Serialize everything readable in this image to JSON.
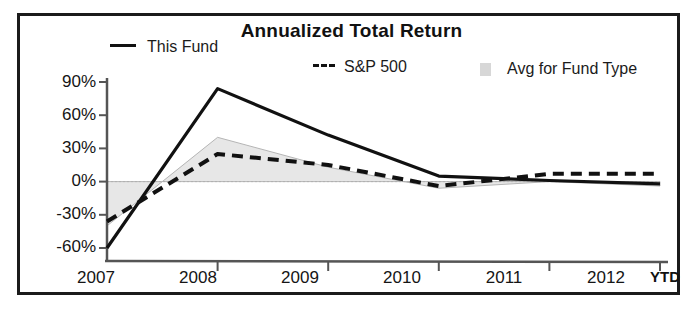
{
  "chart_data": {
    "type": "line",
    "title": "Annualized Total Return",
    "xlabel": "",
    "ylabel": "",
    "categories": [
      "2007",
      "2008",
      "2009",
      "2010",
      "2011",
      "2012"
    ],
    "x_axis_note": "YTD",
    "ylim": [
      -60,
      90
    ],
    "ytick_labels": [
      "90%",
      "60%",
      "30%",
      "0%",
      "-30%",
      "-60%"
    ],
    "ytick_values": [
      90,
      60,
      30,
      0,
      -30,
      -60
    ],
    "grid": false,
    "zero_line": true,
    "legend_position": "top",
    "series": [
      {
        "name": "This Fund",
        "style": "solid",
        "color": "#111111",
        "values": [
          -60,
          84,
          42,
          5,
          1,
          -2
        ]
      },
      {
        "name": "S&P 500",
        "style": "dashed",
        "color": "#111111",
        "values": [
          -36,
          25,
          15,
          -4,
          7,
          7
        ]
      },
      {
        "name": "Avg for Fund Type",
        "style": "band",
        "color": "#c9c9c9",
        "values": [
          -40,
          40,
          13,
          -6,
          0,
          -4
        ]
      }
    ]
  },
  "legend": {
    "this_fund": "This Fund",
    "sp500": "S&P 500",
    "avg_fund_type": "Avg for Fund Type"
  },
  "axes": {
    "y_labels": [
      "90%",
      "60%",
      "30%",
      "0%",
      "-30%",
      "-60%"
    ],
    "x_labels": [
      "2007",
      "2008",
      "2009",
      "2010",
      "2011",
      "2012"
    ],
    "ytd_label": "YTD"
  },
  "colors": {
    "frame": "#1b1b1b",
    "series_line": "#111111",
    "band_fill": "#c9c9c9",
    "axis": "#555555"
  }
}
